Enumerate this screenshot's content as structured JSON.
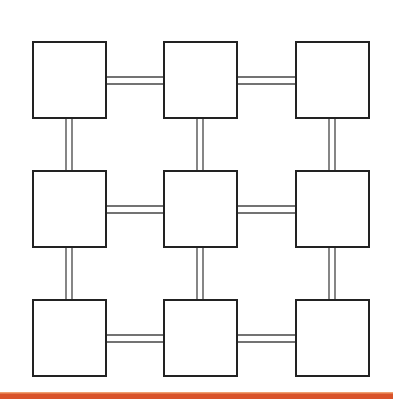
{
  "diagram": {
    "type": "grid-network",
    "rows": 3,
    "cols": 3,
    "nodes": [
      {
        "id": "n11",
        "row": 0,
        "col": 0,
        "label": ""
      },
      {
        "id": "n12",
        "row": 0,
        "col": 1,
        "label": ""
      },
      {
        "id": "n13",
        "row": 0,
        "col": 2,
        "label": ""
      },
      {
        "id": "n21",
        "row": 1,
        "col": 0,
        "label": ""
      },
      {
        "id": "n22",
        "row": 1,
        "col": 1,
        "label": ""
      },
      {
        "id": "n23",
        "row": 1,
        "col": 2,
        "label": ""
      },
      {
        "id": "n31",
        "row": 2,
        "col": 0,
        "label": ""
      },
      {
        "id": "n32",
        "row": 2,
        "col": 1,
        "label": ""
      },
      {
        "id": "n33",
        "row": 2,
        "col": 2,
        "label": ""
      }
    ],
    "edges": [
      {
        "from": "n11",
        "to": "n12",
        "style": "double"
      },
      {
        "from": "n12",
        "to": "n13",
        "style": "double"
      },
      {
        "from": "n21",
        "to": "n22",
        "style": "double"
      },
      {
        "from": "n22",
        "to": "n23",
        "style": "double"
      },
      {
        "from": "n31",
        "to": "n32",
        "style": "double"
      },
      {
        "from": "n32",
        "to": "n33",
        "style": "double"
      },
      {
        "from": "n11",
        "to": "n21",
        "style": "double"
      },
      {
        "from": "n21",
        "to": "n31",
        "style": "double"
      },
      {
        "from": "n12",
        "to": "n22",
        "style": "double"
      },
      {
        "from": "n22",
        "to": "n32",
        "style": "double"
      },
      {
        "from": "n13",
        "to": "n23",
        "style": "double"
      },
      {
        "from": "n23",
        "to": "n33",
        "style": "double"
      }
    ]
  },
  "colors": {
    "node_stroke": "#222222",
    "edge_stroke": "#444444",
    "footer_bar": "#d9532a",
    "footer_bar_highlight": "#f0a070"
  }
}
